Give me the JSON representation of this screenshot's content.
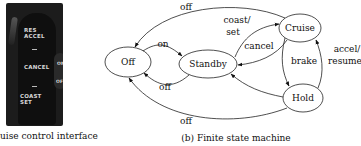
{
  "panel_a": {
    "caption": "uise control interface",
    "caption_full": "(a) Cruise control interface",
    "photo_labels": {
      "res_accel": "RES\nACCEL",
      "cancel": "CANCEL",
      "on": "ON",
      "off": "OFF",
      "coast_set": "COAST\nSET"
    }
  },
  "panel_b": {
    "caption": "(b) Finite state machine",
    "states": [
      {
        "id": "off",
        "label": "Off"
      },
      {
        "id": "standby",
        "label": "Standby"
      },
      {
        "id": "cruise",
        "label": "Cruise"
      },
      {
        "id": "hold",
        "label": "Hold"
      }
    ],
    "transitions": [
      {
        "from": "Cruise",
        "to": "Off",
        "label": "off"
      },
      {
        "from": "Off",
        "to": "Standby",
        "label": "on"
      },
      {
        "from": "Standby",
        "to": "Off",
        "label": "off"
      },
      {
        "from": "Standby",
        "to": "Cruise",
        "label_line1": "coast/",
        "label_line2": "set"
      },
      {
        "from": "Cruise",
        "to": "Standby",
        "label": "cancel"
      },
      {
        "from": "Cruise",
        "to": "Hold",
        "label": "brake"
      },
      {
        "from": "Hold",
        "to": "Cruise",
        "label_line1": "accel/",
        "label_line2": "resume"
      },
      {
        "from": "Hold",
        "to": "Standby",
        "label": ""
      },
      {
        "from": "Hold",
        "to": "Off",
        "label": "off"
      }
    ]
  }
}
